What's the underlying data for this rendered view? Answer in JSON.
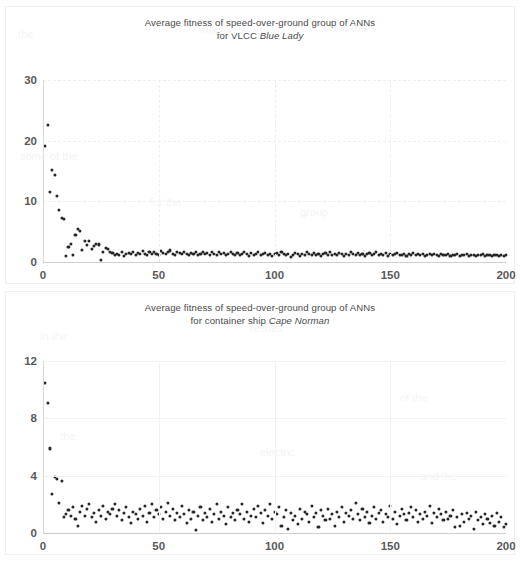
{
  "document": {
    "background_color": "#ffffff",
    "figure_count": 2
  },
  "charts": [
    {
      "id": "chart-blue-lady",
      "title_line1": "Average fitness of speed-over-ground group of ANNs",
      "title_line2_prefix": "for VLCC ",
      "title_line2_ship": "Blue Lady",
      "axis_text_color": "#595959",
      "marker_color": "#262626"
    },
    {
      "id": "chart-cape-norman",
      "title_line1": "Average fitness of speed-over-ground group of ANNs",
      "title_line2_prefix": "for container ship ",
      "title_line2_ship": "Cape Norman",
      "axis_text_color": "#595959",
      "marker_color": "#262626"
    }
  ],
  "chart_data": [
    {
      "type": "scatter",
      "title": "Average fitness of speed-over-ground group of ANNs for VLCC Blue Lady",
      "xlabel": "",
      "ylabel": "",
      "xlim": [
        0,
        200
      ],
      "ylim": [
        0,
        30
      ],
      "xticks": [
        0,
        50,
        100,
        150,
        200
      ],
      "yticks": [
        0,
        10,
        20,
        30
      ],
      "grid": true,
      "legend": false,
      "marker": "circle",
      "series_name": "Average fitness",
      "x": [
        1,
        2,
        3,
        4,
        5,
        6,
        7,
        8,
        9,
        10,
        11,
        12,
        13,
        14,
        15,
        16,
        17,
        18,
        19,
        20,
        21,
        22,
        23,
        24,
        25,
        26,
        27,
        28,
        29,
        30,
        31,
        32,
        33,
        34,
        35,
        36,
        37,
        38,
        39,
        40,
        41,
        42,
        43,
        44,
        45,
        46,
        47,
        48,
        49,
        50,
        51,
        52,
        53,
        54,
        55,
        56,
        57,
        58,
        59,
        60,
        61,
        62,
        63,
        64,
        65,
        66,
        67,
        68,
        69,
        70,
        71,
        72,
        73,
        74,
        75,
        76,
        77,
        78,
        79,
        80,
        81,
        82,
        83,
        84,
        85,
        86,
        87,
        88,
        89,
        90,
        91,
        92,
        93,
        94,
        95,
        96,
        97,
        98,
        99,
        100,
        101,
        102,
        103,
        104,
        105,
        106,
        107,
        108,
        109,
        110,
        111,
        112,
        113,
        114,
        115,
        116,
        117,
        118,
        119,
        120,
        121,
        122,
        123,
        124,
        125,
        126,
        127,
        128,
        129,
        130,
        131,
        132,
        133,
        134,
        135,
        136,
        137,
        138,
        139,
        140,
        141,
        142,
        143,
        144,
        145,
        146,
        147,
        148,
        149,
        150,
        151,
        152,
        153,
        154,
        155,
        156,
        157,
        158,
        159,
        160,
        161,
        162,
        163,
        164,
        165,
        166,
        167,
        168,
        169,
        170,
        171,
        172,
        173,
        174,
        175,
        176,
        177,
        178,
        179,
        180,
        181,
        182,
        183,
        184,
        185,
        186,
        187,
        188,
        189,
        190,
        191,
        192,
        193,
        194,
        195,
        196,
        197,
        198,
        199,
        200
      ],
      "y": [
        19.2,
        22.6,
        11.5,
        15.2,
        14.3,
        10.9,
        8.6,
        7.2,
        7.1,
        1.0,
        2.5,
        3.0,
        1.1,
        4.4,
        5.4,
        5.1,
        2.0,
        3.4,
        2.8,
        3.4,
        2.1,
        2.6,
        3.0,
        2.9,
        0.4,
        1.6,
        2.3,
        2.2,
        1.6,
        1.5,
        1.2,
        1.4,
        1.1,
        1.6,
        1.0,
        1.3,
        1.5,
        1.4,
        1.6,
        1.2,
        1.5,
        1.3,
        1.8,
        1.4,
        1.1,
        1.6,
        1.3,
        1.7,
        1.4,
        1.2,
        1.8,
        1.5,
        1.3,
        1.6,
        1.9,
        1.4,
        1.2,
        1.7,
        1.5,
        1.3,
        1.6,
        1.4,
        1.1,
        1.5,
        1.3,
        1.7,
        1.2,
        1.4,
        1.6,
        1.3,
        1.5,
        1.2,
        1.7,
        1.4,
        1.1,
        1.6,
        1.3,
        1.5,
        1.2,
        1.4,
        1.6,
        1.3,
        1.1,
        1.5,
        1.2,
        1.4,
        1.7,
        1.3,
        1.0,
        1.5,
        1.2,
        1.4,
        1.6,
        1.1,
        1.3,
        1.5,
        1.2,
        1.4,
        1.0,
        1.3,
        1.5,
        1.2,
        1.6,
        1.3,
        1.1,
        1.4,
        0.9,
        1.2,
        1.5,
        1.3,
        1.0,
        1.4,
        1.2,
        1.6,
        1.3,
        1.1,
        1.5,
        1.2,
        1.4,
        1.0,
        1.3,
        1.5,
        1.2,
        1.6,
        1.1,
        1.4,
        1.2,
        1.5,
        1.3,
        1.0,
        1.4,
        1.2,
        1.6,
        1.3,
        1.1,
        1.5,
        1.2,
        1.4,
        1.0,
        1.3,
        1.5,
        1.2,
        1.4,
        1.6,
        1.1,
        1.3,
        1.2,
        1.5,
        1.0,
        1.4,
        1.2,
        1.3,
        1.5,
        1.1,
        1.2,
        1.4,
        1.0,
        1.3,
        1.2,
        1.5,
        1.1,
        1.3,
        1.2,
        1.4,
        1.0,
        1.2,
        1.3,
        1.1,
        1.4,
        1.2,
        1.0,
        1.3,
        1.1,
        1.2,
        1.4,
        1.0,
        1.2,
        1.1,
        1.3,
        1.0,
        1.2,
        1.1,
        1.3,
        1.0,
        1.2,
        1.1,
        1.0,
        1.2,
        1.1,
        1.3,
        1.0,
        1.1,
        1.2,
        1.0,
        1.1,
        1.2,
        1.0,
        1.1,
        1.0,
        1.1
      ]
    },
    {
      "type": "scatter",
      "title": "Average fitness of speed-over-ground group of ANNs for container ship Cape Norman",
      "xlabel": "",
      "ylabel": "",
      "xlim": [
        0,
        200
      ],
      "ylim": [
        0,
        12
      ],
      "xticks": [
        0,
        50,
        100,
        150,
        200
      ],
      "yticks": [
        0,
        4,
        8,
        12
      ],
      "grid": true,
      "legend": false,
      "marker": "circle",
      "series_name": "Average fitness",
      "x": [
        1,
        2,
        3,
        4,
        5,
        6,
        7,
        8,
        9,
        10,
        11,
        12,
        13,
        14,
        15,
        16,
        17,
        18,
        19,
        20,
        21,
        22,
        23,
        24,
        25,
        26,
        27,
        28,
        29,
        30,
        31,
        32,
        33,
        34,
        35,
        36,
        37,
        38,
        39,
        40,
        41,
        42,
        43,
        44,
        45,
        46,
        47,
        48,
        49,
        50,
        51,
        52,
        53,
        54,
        55,
        56,
        57,
        58,
        59,
        60,
        61,
        62,
        63,
        64,
        65,
        66,
        67,
        68,
        69,
        70,
        71,
        72,
        73,
        74,
        75,
        76,
        77,
        78,
        79,
        80,
        81,
        82,
        83,
        84,
        85,
        86,
        87,
        88,
        89,
        90,
        91,
        92,
        93,
        94,
        95,
        96,
        97,
        98,
        99,
        100,
        101,
        102,
        103,
        104,
        105,
        106,
        107,
        108,
        109,
        110,
        111,
        112,
        113,
        114,
        115,
        116,
        117,
        118,
        119,
        120,
        121,
        122,
        123,
        124,
        125,
        126,
        127,
        128,
        129,
        130,
        131,
        132,
        133,
        134,
        135,
        136,
        137,
        138,
        139,
        140,
        141,
        142,
        143,
        144,
        145,
        146,
        147,
        148,
        149,
        150,
        151,
        152,
        153,
        154,
        155,
        156,
        157,
        158,
        159,
        160,
        161,
        162,
        163,
        164,
        165,
        166,
        167,
        168,
        169,
        170,
        171,
        172,
        173,
        174,
        175,
        176,
        177,
        178,
        179,
        180,
        181,
        182,
        183,
        184,
        185,
        186,
        187,
        188,
        189,
        190,
        191,
        192,
        193,
        194,
        195,
        196,
        197,
        198,
        199,
        200
      ],
      "y": [
        10.5,
        9.1,
        5.9,
        2.7,
        3.9,
        3.8,
        2.1,
        3.6,
        1.1,
        1.3,
        1.6,
        1.2,
        1.8,
        1.0,
        0.5,
        1.5,
        1.9,
        1.2,
        1.7,
        2.0,
        1.1,
        1.4,
        0.8,
        1.6,
        1.2,
        1.9,
        1.0,
        1.5,
        1.3,
        1.7,
        2.0,
        1.2,
        1.6,
        0.9,
        1.4,
        1.8,
        1.1,
        0.7,
        1.5,
        1.3,
        1.0,
        1.7,
        1.2,
        1.9,
        0.8,
        1.4,
        2.0,
        1.1,
        1.6,
        1.3,
        1.8,
        1.0,
        1.5,
        2.1,
        1.2,
        1.7,
        0.9,
        1.4,
        1.1,
        1.9,
        1.3,
        0.7,
        1.6,
        1.0,
        1.5,
        0.2,
        1.2,
        1.8,
        0.9,
        1.4,
        1.1,
        1.7,
        0.8,
        1.3,
        2.0,
        1.0,
        1.5,
        1.2,
        0.6,
        1.8,
        1.1,
        1.4,
        0.9,
        1.6,
        1.3,
        2.0,
        1.0,
        1.5,
        0.8,
        1.2,
        1.7,
        1.1,
        1.9,
        1.4,
        0.7,
        1.6,
        1.2,
        2.0,
        1.0,
        1.5,
        1.3,
        1.8,
        0.5,
        1.1,
        1.6,
        0.3,
        1.4,
        0.9,
        1.2,
        0.6,
        1.7,
        1.0,
        1.5,
        1.3,
        0.8,
        1.9,
        1.1,
        1.4,
        0.4,
        1.6,
        1.2,
        0.9,
        1.7,
        1.0,
        1.3,
        0.5,
        1.5,
        1.1,
        1.8,
        0.8,
        1.4,
        1.2,
        1.6,
        1.0,
        2.1,
        1.3,
        0.9,
        1.7,
        1.1,
        1.5,
        0.7,
        1.2,
        1.8,
        1.0,
        1.4,
        1.6,
        0.8,
        1.3,
        1.1,
        1.9,
        1.0,
        1.5,
        0.6,
        1.2,
        1.7,
        1.3,
        0.9,
        1.4,
        1.8,
        1.1,
        1.6,
        0.8,
        1.3,
        1.0,
        1.5,
        1.2,
        1.9,
        0.7,
        1.4,
        1.1,
        1.7,
        1.3,
        0.9,
        1.5,
        1.0,
        1.2,
        1.6,
        0.4,
        1.1,
        0.5,
        1.3,
        0.8,
        1.4,
        1.0,
        1.2,
        0.3,
        1.5,
        0.9,
        1.1,
        0.6,
        1.3,
        1.0,
        0.7,
        1.2,
        0.5,
        1.4,
        0.8,
        1.1,
        0.4,
        0.6
      ]
    }
  ],
  "ghost_text": [
    "the",
    "electric",
    "and the",
    "some of the",
    "for the",
    "group",
    "in the",
    "results",
    "of the"
  ]
}
